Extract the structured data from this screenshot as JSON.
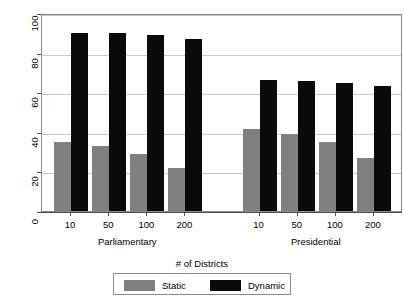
{
  "chart_data": {
    "type": "bar",
    "title": "",
    "xlabel": "# of Districts",
    "ylabel": "Nationalization Score",
    "ylim": [
      0,
      100
    ],
    "yticks": [
      0,
      20,
      40,
      60,
      80,
      100
    ],
    "grid": true,
    "legend_position": "bottom",
    "categories": [
      "10",
      "50",
      "100",
      "200",
      "10",
      "50",
      "100",
      "200"
    ],
    "groups": [
      {
        "name": "Parliamentary",
        "categories": [
          "10",
          "50",
          "100",
          "200"
        ]
      },
      {
        "name": "Presidential",
        "categories": [
          "10",
          "50",
          "100",
          "200"
        ]
      }
    ],
    "series": [
      {
        "name": "Static",
        "color": "#808080",
        "values": [
          35,
          33,
          29,
          21.5,
          41.5,
          39,
          35,
          27
        ]
      },
      {
        "name": "Dynamic",
        "color": "#0a0a0a",
        "values": [
          90,
          90,
          89,
          87,
          66,
          65.5,
          64.5,
          63
        ]
      }
    ]
  },
  "axes": {
    "y_title": "Nationalization Score",
    "y_tick_labels": [
      "0",
      "20",
      "40",
      "60",
      "80",
      "100"
    ],
    "x_tick_labels": [
      "10",
      "50",
      "100",
      "200",
      "10",
      "50",
      "100",
      "200"
    ],
    "group_labels": [
      "Parliamentary",
      "Presidential"
    ]
  },
  "legend": {
    "title": "# of Districts",
    "items": [
      {
        "label": "Static",
        "color": "#808080"
      },
      {
        "label": "Dynamic",
        "color": "#0a0a0a"
      }
    ]
  },
  "colors": {
    "static": "#808080",
    "dynamic": "#0a0a0a",
    "grid": "#c9c9c9",
    "axis": "#4d4d4d",
    "frame": "#8a8a8a",
    "background": "#ffffff"
  }
}
